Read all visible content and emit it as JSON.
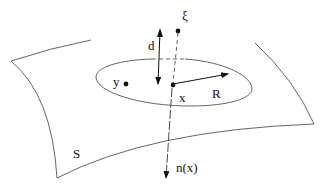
{
  "diagram": {
    "labels": {
      "xi": "ξ",
      "d": "d",
      "y": "y",
      "x": "x",
      "R": "R",
      "S": "S",
      "normal": "n(x)"
    },
    "colors": {
      "stroke": "#444444",
      "ink": "#111111",
      "background": "#ffffff"
    }
  }
}
